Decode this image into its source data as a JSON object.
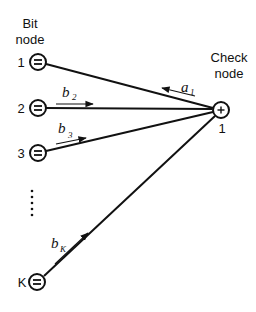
{
  "diagram": {
    "bit_node_header": [
      "Bit",
      "node"
    ],
    "check_node_header": [
      "Check",
      "node"
    ],
    "check_node": {
      "symbol": "+",
      "index": "1"
    },
    "bit_nodes": [
      {
        "index": "1",
        "symbol": "="
      },
      {
        "index": "2",
        "symbol": "="
      },
      {
        "index": "3",
        "symbol": "="
      },
      {
        "index": "K",
        "symbol": "="
      }
    ],
    "ellipsis": "⋮",
    "messages": {
      "a1": {
        "base": "a",
        "sub": "1",
        "direction": "check-to-bit"
      },
      "b2": {
        "base": "b",
        "sub": "2",
        "direction": "bit-to-check"
      },
      "b3": {
        "base": "b",
        "sub": "3",
        "direction": "bit-to-check"
      },
      "bK": {
        "base": "b",
        "sub": "K",
        "direction": "bit-to-check"
      }
    }
  }
}
